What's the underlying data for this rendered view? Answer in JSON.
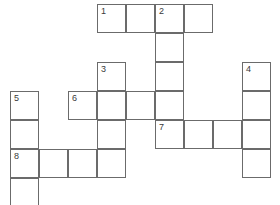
{
  "puzzle": {
    "type": "crossword-grid",
    "title": "",
    "cell_size": 29,
    "origin": {
      "x": 10,
      "y": 4
    },
    "columns": 9,
    "rows": 7,
    "colors": {
      "grid_line": "#6b6b6b",
      "cell_fill": "#ffffff",
      "number_text": "#3a3a3a",
      "background": "#ffffff"
    },
    "clue_numbers": [
      1,
      2,
      3,
      4,
      5,
      6,
      7,
      8
    ],
    "entries": [
      {
        "number": 1,
        "direction": "across",
        "col": 3,
        "row": 0,
        "length": 4
      },
      {
        "number": 2,
        "direction": "down",
        "col": 5,
        "row": 0,
        "length": 5
      },
      {
        "number": 3,
        "direction": "down",
        "col": 3,
        "row": 2,
        "length": 4
      },
      {
        "number": 4,
        "direction": "down",
        "col": 8,
        "row": 2,
        "length": 4
      },
      {
        "number": 5,
        "direction": "down",
        "col": 0,
        "row": 3,
        "length": 4
      },
      {
        "number": 6,
        "direction": "across",
        "col": 2,
        "row": 3,
        "length": 4
      },
      {
        "number": 7,
        "direction": "across",
        "col": 5,
        "row": 4,
        "length": 4
      },
      {
        "number": 8,
        "direction": "across",
        "col": 0,
        "row": 5,
        "length": 4
      }
    ],
    "cells": [
      {
        "col": 3,
        "row": 0,
        "number": "1",
        "letter": ""
      },
      {
        "col": 4,
        "row": 0,
        "number": "",
        "letter": ""
      },
      {
        "col": 5,
        "row": 0,
        "number": "2",
        "letter": ""
      },
      {
        "col": 6,
        "row": 0,
        "number": "",
        "letter": ""
      },
      {
        "col": 5,
        "row": 1,
        "number": "",
        "letter": ""
      },
      {
        "col": 3,
        "row": 2,
        "number": "3",
        "letter": ""
      },
      {
        "col": 5,
        "row": 2,
        "number": "",
        "letter": ""
      },
      {
        "col": 8,
        "row": 2,
        "number": "4",
        "letter": ""
      },
      {
        "col": 0,
        "row": 3,
        "number": "5",
        "letter": ""
      },
      {
        "col": 2,
        "row": 3,
        "number": "6",
        "letter": ""
      },
      {
        "col": 3,
        "row": 3,
        "number": "",
        "letter": ""
      },
      {
        "col": 4,
        "row": 3,
        "number": "",
        "letter": ""
      },
      {
        "col": 5,
        "row": 3,
        "number": "",
        "letter": ""
      },
      {
        "col": 8,
        "row": 3,
        "number": "",
        "letter": ""
      },
      {
        "col": 0,
        "row": 4,
        "number": "",
        "letter": ""
      },
      {
        "col": 3,
        "row": 4,
        "number": "",
        "letter": ""
      },
      {
        "col": 5,
        "row": 4,
        "number": "7",
        "letter": ""
      },
      {
        "col": 6,
        "row": 4,
        "number": "",
        "letter": ""
      },
      {
        "col": 7,
        "row": 4,
        "number": "",
        "letter": ""
      },
      {
        "col": 8,
        "row": 4,
        "number": "",
        "letter": ""
      },
      {
        "col": 0,
        "row": 5,
        "number": "8",
        "letter": ""
      },
      {
        "col": 1,
        "row": 5,
        "number": "",
        "letter": ""
      },
      {
        "col": 2,
        "row": 5,
        "number": "",
        "letter": ""
      },
      {
        "col": 3,
        "row": 5,
        "number": "",
        "letter": ""
      },
      {
        "col": 8,
        "row": 5,
        "number": "",
        "letter": ""
      },
      {
        "col": 0,
        "row": 6,
        "number": "",
        "letter": ""
      }
    ]
  }
}
